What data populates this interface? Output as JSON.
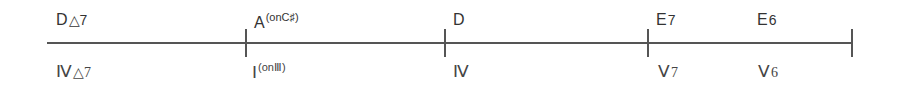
{
  "diagram": {
    "type": "chord-progression",
    "measures": [
      {
        "chord": {
          "root": "D",
          "quality": "△7",
          "bass": ""
        },
        "roman": {
          "numeral": "Ⅳ",
          "quality": "△7",
          "bass": ""
        }
      },
      {
        "chord": {
          "root": "A",
          "quality": "",
          "bass": "(onC♯)"
        },
        "roman": {
          "numeral": "Ⅰ",
          "quality": "",
          "bass": "(onⅢ)"
        }
      },
      {
        "chord": {
          "root": "D",
          "quality": "",
          "bass": ""
        },
        "roman": {
          "numeral": "Ⅳ",
          "quality": "",
          "bass": ""
        }
      },
      {
        "chord": {
          "root": "E",
          "quality": "7",
          "bass": ""
        },
        "roman": {
          "numeral": "Ⅴ",
          "quality": "7",
          "bass": ""
        }
      },
      {
        "chord": {
          "root": "E",
          "quality": "6",
          "bass": ""
        },
        "roman": {
          "numeral": "Ⅴ",
          "quality": "6",
          "bass": ""
        }
      }
    ]
  }
}
